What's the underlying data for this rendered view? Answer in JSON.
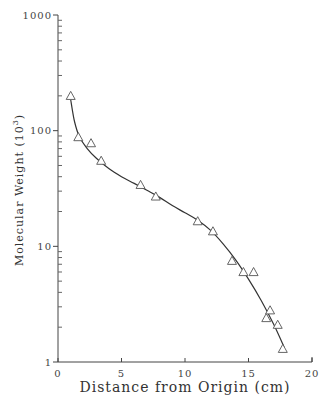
{
  "chart_data": {
    "type": "scatter",
    "title": "",
    "xlabel": "Distance from Origin (cm)",
    "ylabel": "Molecular Weight (10^3)",
    "ylabel_main": "Molecular Weight (10",
    "ylabel_sup": "3",
    "ylabel_end": ")",
    "xlim": [
      0,
      20
    ],
    "ylim": [
      1,
      1000
    ],
    "yscale": "log",
    "grid": false,
    "legend": null,
    "x_ticks": [
      0,
      5,
      10,
      15,
      20
    ],
    "x_tick_labels": [
      "0",
      "5",
      "10",
      "15",
      "20"
    ],
    "y_ticks": [
      1,
      10,
      100,
      1000
    ],
    "y_tick_labels": [
      "1",
      "10",
      "100",
      "1000"
    ],
    "series": [
      {
        "name": "Standards",
        "marker": "open-triangle",
        "x": [
          1.0,
          1.6,
          2.6,
          3.4,
          6.5,
          7.7,
          11.0,
          12.2,
          13.7,
          14.6,
          15.4,
          16.4,
          16.7,
          17.3,
          17.7
        ],
        "y": [
          200,
          88,
          78,
          55,
          34,
          27,
          16.5,
          13.5,
          7.5,
          6.0,
          6.0,
          2.4,
          2.8,
          2.1,
          1.3
        ]
      },
      {
        "name": "Fitted curve",
        "type": "line",
        "x": [
          1.0,
          1.3,
          1.7,
          2.3,
          3.0,
          4.0,
          5.0,
          6.0,
          7.0,
          8.0,
          9.0,
          10.0,
          11.0,
          12.0,
          13.0,
          14.0,
          15.0,
          16.0,
          17.0,
          17.8
        ],
        "y": [
          185,
          120,
          88,
          70,
          58,
          47,
          40,
          35,
          30.5,
          26.5,
          22.5,
          19.5,
          16.8,
          13.8,
          10.5,
          7.6,
          5.2,
          3.4,
          2.1,
          1.35
        ]
      }
    ]
  }
}
